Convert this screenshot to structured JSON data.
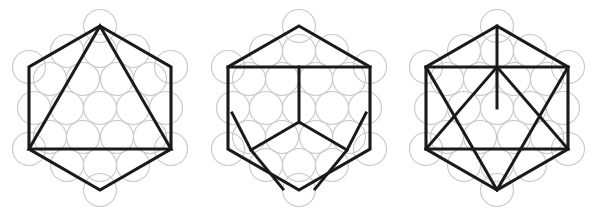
{
  "figure": {
    "caption": "",
    "background_color": "#ffffff",
    "width": 598,
    "height": 217,
    "panel_count": 3
  },
  "style": {
    "circle_stroke_color": "#c9c9c9",
    "line_stroke_color": "#1a1a1a",
    "circle_stroke_width": 1.15,
    "hexagon_stroke_width": 3.1,
    "inner_stroke_width": 3.0
  },
  "lattice": {
    "description": "centered hexagonal packing of 19 circles, 5 rows",
    "circle_count": 19,
    "circle_radius": 16.5,
    "spacing_x": 33,
    "spacing_y": 28.6,
    "rows": [
      3,
      4,
      5,
      4,
      3
    ]
  },
  "panels": [
    {
      "index": 1,
      "name": "hexagon-with-inscribed-triangle",
      "label": "",
      "origin_x": 22,
      "center": {
        "x": 100,
        "y": 108
      },
      "hexagon_radius": 82,
      "hexagon_vertices": [
        {
          "name": "top",
          "x": 100,
          "y": 26
        },
        {
          "name": "upper-right",
          "x": 171,
          "y": 67
        },
        {
          "name": "lower-right",
          "x": 171,
          "y": 149
        },
        {
          "name": "bottom",
          "x": 100,
          "y": 190
        },
        {
          "name": "lower-left",
          "x": 29,
          "y": 149
        },
        {
          "name": "upper-left",
          "x": 29,
          "y": 67
        }
      ],
      "inner_paths": [
        {
          "name": "triangle-left-edge",
          "from": "top",
          "to": "lower-left"
        },
        {
          "name": "triangle-right-edge",
          "from": "top",
          "to": "lower-right"
        },
        {
          "name": "triangle-base",
          "from": "lower-left",
          "to": "lower-right"
        }
      ]
    },
    {
      "index": 2,
      "name": "hexagon-with-y-star-partition",
      "label": "",
      "origin_x": 214,
      "center": {
        "x": 299,
        "y": 108
      },
      "hexagon_radius": 82,
      "hexagon_vertices": [
        {
          "name": "top",
          "x": 299,
          "y": 26
        },
        {
          "name": "upper-right",
          "x": 370,
          "y": 67
        },
        {
          "name": "lower-right",
          "x": 370,
          "y": 149
        },
        {
          "name": "bottom",
          "x": 299,
          "y": 190
        },
        {
          "name": "lower-left",
          "x": 228,
          "y": 149
        },
        {
          "name": "upper-left",
          "x": 228,
          "y": 67
        }
      ],
      "inner_paths": [
        {
          "name": "top-horizontal-chord",
          "from": "upper-left",
          "to": "upper-right"
        },
        {
          "name": "y-stem-vertical",
          "from": "top-chord-midpoint",
          "to": "center"
        },
        {
          "name": "y-arm-left",
          "from": "center",
          "to": "lower-left-inner"
        },
        {
          "name": "y-arm-right",
          "from": "center",
          "to": "lower-right-inner"
        },
        {
          "name": "diagonal-to-lower-left-vertex",
          "from": "lower-left-inner",
          "to": "lower-left"
        },
        {
          "name": "diagonal-to-lower-right-vertex",
          "from": "lower-right-inner",
          "to": "lower-right"
        }
      ]
    },
    {
      "index": 3,
      "name": "hexagon-with-hexagram-chords",
      "label": "",
      "origin_x": 408,
      "center": {
        "x": 497,
        "y": 108
      },
      "hexagon_radius": 82,
      "hexagon_vertices": [
        {
          "name": "top",
          "x": 497,
          "y": 26
        },
        {
          "name": "upper-right",
          "x": 568,
          "y": 67
        },
        {
          "name": "lower-right",
          "x": 568,
          "y": 149
        },
        {
          "name": "bottom",
          "x": 497,
          "y": 190
        },
        {
          "name": "lower-left",
          "x": 426,
          "y": 149
        },
        {
          "name": "upper-left",
          "x": 426,
          "y": 67
        }
      ],
      "inner_paths": [
        {
          "name": "upper-horizontal-chord",
          "from": "upper-left",
          "to": "upper-right"
        },
        {
          "name": "lower-horizontal-chord",
          "from": "lower-left",
          "to": "lower-right"
        },
        {
          "name": "vertical-apex-stem",
          "from": "top",
          "to": "center"
        },
        {
          "name": "downward-triangle-left",
          "from": "upper-left",
          "to": "bottom"
        },
        {
          "name": "downward-triangle-right",
          "from": "upper-right",
          "to": "bottom"
        },
        {
          "name": "upward-triangle-left",
          "from": "lower-left",
          "to": "center-top"
        },
        {
          "name": "upward-triangle-right",
          "from": "lower-right",
          "to": "center-top"
        }
      ]
    }
  ]
}
